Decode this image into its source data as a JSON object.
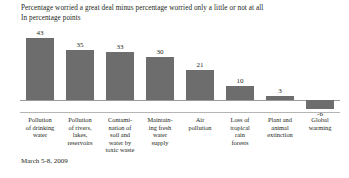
{
  "header": {
    "title_line1": "Percentage worried a great deal minus percentage worried only a little or not at all",
    "title_line2": "In percentage points"
  },
  "footer": {
    "date": "March 5-8, 2009"
  },
  "chart_data": {
    "type": "bar",
    "title": "Percentage worried a great deal minus percentage worried only a little or not at all",
    "subtitle": "In percentage points",
    "xlabel": "",
    "ylabel": "",
    "ylim": [
      -10,
      45
    ],
    "grid": false,
    "legend": false,
    "bar_color": "#6d6d6d",
    "zero_line_color": "#9b9b9b",
    "categories": [
      "Pollution of drinking water",
      "Pollution of rivers, lakes, reservoirs",
      "Contamination of soil and water by toxic waste",
      "Maintaining fresh water supply",
      "Air pollution",
      "Loss of tropical rain forests",
      "Plant and animal extinction",
      "Global warming"
    ],
    "category_lines": [
      [
        "Pollution",
        "of drinking",
        "water"
      ],
      [
        "Pollution",
        "of rivers,",
        "lakes,",
        "reservoirs"
      ],
      [
        "Contami-",
        "nation of",
        "soil and",
        "water by",
        "toxic waste"
      ],
      [
        "Maintain-",
        "ing fresh",
        "water",
        "supply"
      ],
      [
        "Air",
        "pollution"
      ],
      [
        "Loss of",
        "tropical",
        "rain",
        "forests"
      ],
      [
        "Plant and",
        "animal",
        "extinction"
      ],
      [
        "Global",
        "warming"
      ]
    ],
    "values": [
      43,
      35,
      33,
      30,
      21,
      10,
      3,
      -6
    ],
    "value_labels": [
      "43",
      "35",
      "33",
      "30",
      "21",
      "10",
      "3",
      "-6"
    ]
  }
}
